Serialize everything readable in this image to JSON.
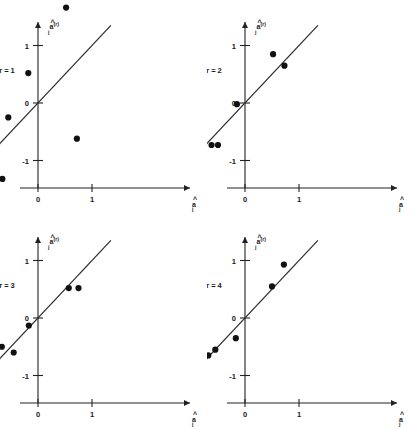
{
  "figure": {
    "panel_count": 4,
    "background_color": "#ffffff",
    "point_color": "#111111",
    "line_color": "#2a2a2a",
    "axis_color": "#222222"
  },
  "axis_titles": {
    "x_symbol": "a",
    "x_subscript": "j",
    "x_hat": "^",
    "y_symbol": "a",
    "y_subscript": "j",
    "y_superscript": "(r)",
    "y_hat": "^"
  },
  "chart_data": [
    {
      "type": "scatter",
      "title": "r = 1",
      "panel_label": "r = 1",
      "xlabel": "â_j",
      "ylabel": "â_j^(r)",
      "xlim": [
        -1.45,
        1.55
      ],
      "ylim": [
        -1.6,
        1.85
      ],
      "xticks": [
        -1,
        0,
        1
      ],
      "xtick_labels": [
        "-1",
        "0",
        "1"
      ],
      "yticks": [
        -1,
        0,
        1
      ],
      "ytick_labels": [
        "-1",
        "0",
        "1"
      ],
      "grid": false,
      "reference_line": {
        "type": "identity",
        "x": [
          -1.25,
          1.35
        ],
        "y": [
          -1.25,
          1.35
        ]
      },
      "points": [
        {
          "x": 0.52,
          "y": 1.66
        },
        {
          "x": -0.18,
          "y": 0.52
        },
        {
          "x": -0.55,
          "y": -0.25
        },
        {
          "x": 0.72,
          "y": -0.62
        },
        {
          "x": -0.66,
          "y": -1.32
        }
      ]
    },
    {
      "type": "scatter",
      "title": "r = 2",
      "panel_label": "r = 2",
      "xlabel": "â_j",
      "ylabel": "â_j^(r)",
      "xlim": [
        -1.45,
        1.55
      ],
      "ylim": [
        -1.6,
        1.85
      ],
      "xticks": [
        -1,
        0,
        1
      ],
      "xtick_labels": [
        "-1",
        "0",
        "1"
      ],
      "yticks": [
        -1,
        0,
        1
      ],
      "ytick_labels": [
        "-1",
        "0",
        "1"
      ],
      "grid": false,
      "reference_line": {
        "type": "identity",
        "x": [
          -1.3,
          1.35
        ],
        "y": [
          -1.3,
          1.35
        ]
      },
      "points": [
        {
          "x": 0.52,
          "y": 0.85
        },
        {
          "x": 0.73,
          "y": 0.65
        },
        {
          "x": -0.15,
          "y": -0.02
        },
        {
          "x": -0.62,
          "y": -0.73
        },
        {
          "x": -0.5,
          "y": -0.73
        }
      ]
    },
    {
      "type": "scatter",
      "title": "r = 3",
      "panel_label": "r = 3",
      "xlabel": "â_j",
      "ylabel": "â_j^(r)",
      "xlim": [
        -1.45,
        1.55
      ],
      "ylim": [
        -1.6,
        1.85
      ],
      "xticks": [
        -1,
        0,
        1
      ],
      "xtick_labels": [
        "-1",
        "0",
        "1"
      ],
      "yticks": [
        -1,
        0,
        1
      ],
      "ytick_labels": [
        "-1",
        "0",
        "1"
      ],
      "grid": false,
      "reference_line": {
        "type": "identity",
        "x": [
          -1.27,
          1.35
        ],
        "y": [
          -1.27,
          1.35
        ]
      },
      "points": [
        {
          "x": 0.57,
          "y": 0.52
        },
        {
          "x": 0.75,
          "y": 0.52
        },
        {
          "x": -0.17,
          "y": -0.13
        },
        {
          "x": -0.67,
          "y": -0.5
        },
        {
          "x": -0.45,
          "y": -0.6
        }
      ]
    },
    {
      "type": "scatter",
      "title": "r = 4",
      "panel_label": "r = 4",
      "xlabel": "â_j",
      "ylabel": "â_j^(r)",
      "xlim": [
        -1.45,
        1.55
      ],
      "ylim": [
        -1.6,
        1.85
      ],
      "xticks": [
        -1,
        0,
        1
      ],
      "xtick_labels": [
        "-1",
        "0",
        "1"
      ],
      "yticks": [
        -1,
        0,
        1
      ],
      "ytick_labels": [
        "-1",
        "0",
        "1"
      ],
      "grid": false,
      "reference_line": {
        "type": "identity",
        "x": [
          -1.28,
          1.35
        ],
        "y": [
          -1.28,
          1.35
        ]
      },
      "points": [
        {
          "x": 0.72,
          "y": 0.93
        },
        {
          "x": 0.5,
          "y": 0.55
        },
        {
          "x": -0.17,
          "y": -0.35
        },
        {
          "x": -0.55,
          "y": -0.55
        },
        {
          "x": -0.68,
          "y": -0.65
        }
      ]
    }
  ]
}
